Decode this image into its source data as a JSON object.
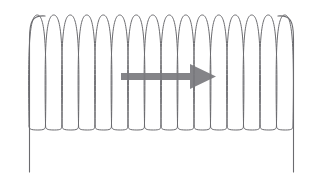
{
  "figure": {
    "background_color": "#ffffff",
    "width": 317,
    "height": 174,
    "caption": ""
  },
  "coil": {
    "label": "coil-spring",
    "stroke_color": "#6b6b6f",
    "stroke_width": 1,
    "loop_count": 16,
    "x_start": 29,
    "x_end": 293,
    "y_top": 15,
    "y_bottom": 130,
    "loop_pitch": 16.5,
    "loop_half_width": 8.2
  },
  "leads": {
    "label": "lead-wires",
    "left_x": 29.5,
    "right_x": 293.5,
    "y_top": 22,
    "y_bottom": 172,
    "stroke_color": "#6b6b6f"
  },
  "arrow": {
    "label": "direction-arrow",
    "color": "#7a7a7e",
    "direction": "right",
    "shaft_x_start": 121,
    "shaft_x_end": 196,
    "shaft_y_center": 76.5,
    "shaft_thickness": 7,
    "head_x_base": 190,
    "head_x_tip": 216,
    "head_y_top": 64,
    "head_y_bottom": 89
  },
  "chart_data": {
    "type": "line",
    "xlabel": "",
    "ylabel": "",
    "xlim": [
      0,
      317
    ],
    "ylim": [
      0,
      174
    ],
    "grid": false,
    "legend": "none",
    "series": [
      {
        "name": "coil",
        "description": "16 tall narrow loops of a helix",
        "loop_count": 16,
        "x_start": 29,
        "x_end": 293,
        "y_top": 15,
        "y_bottom": 130
      },
      {
        "name": "left-lead",
        "description": "vertical wire at left end of coil",
        "x": 29.5,
        "y_from": 22,
        "y_to": 172
      },
      {
        "name": "right-lead",
        "description": "vertical wire at right end of coil",
        "x": 293.5,
        "y_from": 22,
        "y_to": 172
      },
      {
        "name": "arrow",
        "description": "horizontal gray arrow pointing right through coil center",
        "x_from": 121,
        "x_to": 216,
        "y": 76.5
      }
    ]
  }
}
